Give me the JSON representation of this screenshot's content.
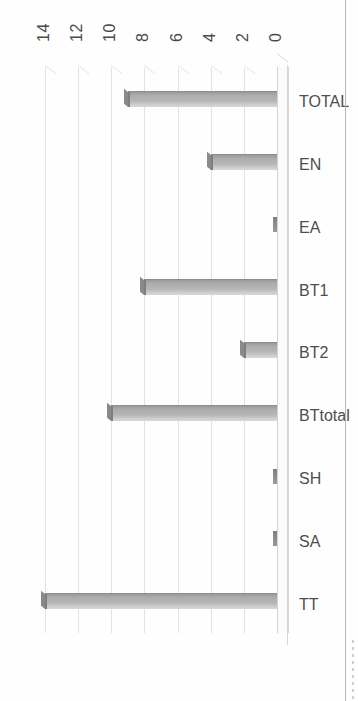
{
  "document": {
    "type": "scanned-page",
    "orientation": "rotated-90-ccw",
    "page_edge_visible": true
  },
  "colors": {
    "bar_fill": "#b6b6b6",
    "bar_top": "#8a8a8a",
    "bar_edge": "#8d8d8d",
    "gridline": "#e2e2e2",
    "axis_text": "#4a4a4a",
    "floor": "#fbfbfb",
    "page_edge": "#b9b9b9",
    "background": "#ffffff"
  },
  "chart_data": {
    "type": "bar",
    "title": "",
    "xlabel": "",
    "ylabel": "",
    "categories": [
      "TT",
      "SA",
      "SH",
      "BTtotal",
      "BT2",
      "BT1",
      "EA",
      "EN",
      "TOTAL"
    ],
    "values": [
      14,
      0,
      0,
      10,
      2,
      8,
      0,
      4,
      9
    ],
    "ylim": [
      0,
      14
    ],
    "yticks": [
      0,
      2,
      4,
      6,
      8,
      10,
      12,
      14
    ],
    "ytick_labels": [
      "0",
      "2",
      "4",
      "6",
      "8",
      "10",
      "12",
      "14"
    ],
    "grid": true,
    "grid_axis": "value",
    "legend": false,
    "legend_position": "none",
    "style": "3d-column",
    "annotations": []
  }
}
